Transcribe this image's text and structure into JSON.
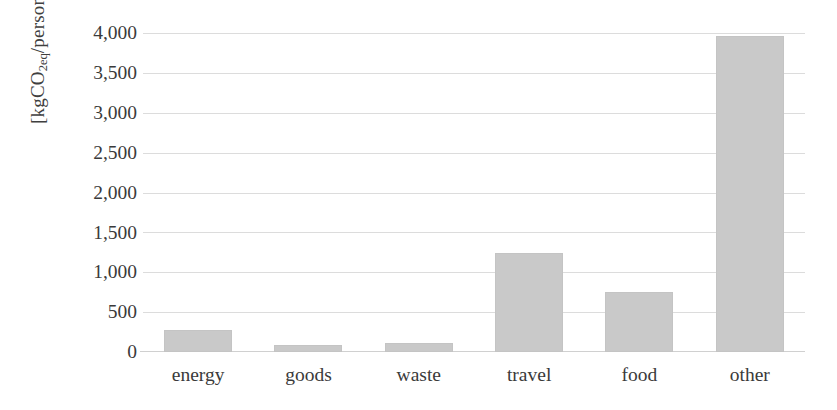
{
  "chart_data": {
    "type": "bar",
    "title": "",
    "subtitle": "",
    "xlabel": "",
    "ylabel": "[kgCO2eq/person]",
    "ylabel_parts": {
      "prefix": "[kgCO",
      "subscript": "2eq",
      "suffix": "/person]"
    },
    "categories": [
      "energy",
      "goods",
      "waste",
      "travel",
      "food",
      "other"
    ],
    "values": [
      280,
      90,
      110,
      1240,
      750,
      3960
    ],
    "series": [
      {
        "name": "emissions",
        "values": [
          280,
          90,
          110,
          1240,
          750,
          3960
        ]
      }
    ],
    "ylim": [
      0,
      4000
    ],
    "yticks": [
      0,
      500,
      1000,
      1500,
      2000,
      2500,
      3000,
      3500,
      4000
    ],
    "ytick_labels": [
      "0",
      "500",
      "1,000",
      "1,500",
      "2,000",
      "2,500",
      "3,000",
      "3,500",
      "4,000"
    ],
    "grid": true,
    "grid_axis": "y",
    "legend": false,
    "legend_position": "none",
    "bar_color": "#c9c9c9",
    "gridline_color": "#dcdcdc",
    "axis_text_color": "#3a3a3a",
    "background_color": "#ffffff"
  }
}
